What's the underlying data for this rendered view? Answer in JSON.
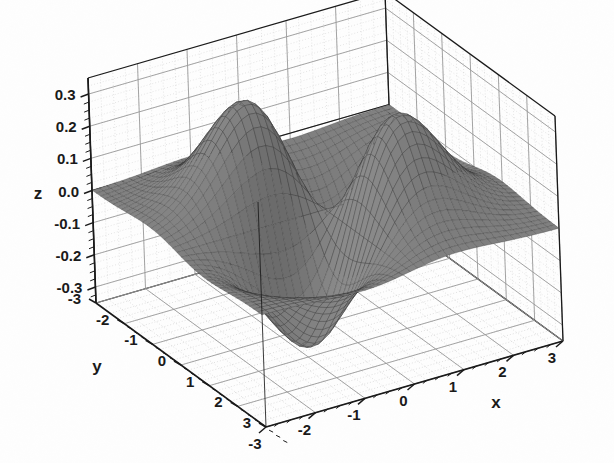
{
  "figure": {
    "kind": "surface-plot",
    "background_color": "#fefefe",
    "ink_color": "#1a1a1a",
    "grid_color": "#9a9a9a",
    "surface_fill": "#5f5f5f",
    "surface_edge": "#2e2e2e"
  },
  "axes": {
    "x": {
      "label": "x",
      "ticks": [
        "-3",
        "-2",
        "-1",
        "0",
        "1",
        "2",
        "3"
      ],
      "tick_values": [
        -3,
        -2,
        -1,
        0,
        1,
        2,
        3
      ],
      "range": [
        -3,
        3
      ]
    },
    "y": {
      "label": "y",
      "ticks": [
        "3",
        "2",
        "1",
        "0",
        "-1",
        "-2",
        "-3"
      ],
      "tick_values": [
        3,
        2,
        1,
        0,
        -1,
        -2,
        -3
      ],
      "range": [
        -3,
        3
      ]
    },
    "z": {
      "label": "z",
      "ticks": [
        "0.3",
        "0.2",
        "0.1",
        "0.0",
        "-0.1",
        "-0.2",
        "-0.3"
      ],
      "tick_values": [
        0.3,
        0.2,
        0.1,
        0.0,
        -0.1,
        -0.2,
        -0.3
      ],
      "range": [
        -0.35,
        0.35
      ]
    }
  },
  "chart_data": {
    "type": "surface",
    "title": "",
    "xlabel": "x",
    "ylabel": "y",
    "zlabel": "z",
    "xlim": [
      -3,
      3
    ],
    "ylim": [
      -3,
      3
    ],
    "zlim": [
      -0.35,
      0.35
    ],
    "xticks": [
      -3,
      -2,
      -1,
      0,
      1,
      2,
      3
    ],
    "yticks": [
      -3,
      -2,
      -1,
      0,
      1,
      2,
      3
    ],
    "zticks": [
      -0.3,
      -0.2,
      -0.1,
      0.0,
      0.1,
      0.2,
      0.3
    ],
    "grid": true,
    "legend": "none",
    "mesh_resolution": 41,
    "projection": {
      "azimuth_deg": 235,
      "elevation_deg": 22
    },
    "function": "z = -x*y*exp(-(x*x + y*y)/2) * 0.86",
    "features": [
      {
        "name": "left-peak",
        "x": -1.0,
        "y": 1.0,
        "z": 0.3
      },
      {
        "name": "right-peak",
        "x": 1.0,
        "y": -1.0,
        "z": 0.32
      },
      {
        "name": "front-trough",
        "x": 1.0,
        "y": 1.0,
        "z": -0.32
      },
      {
        "name": "back-trough",
        "x": -1.0,
        "y": -1.0,
        "z": -0.3
      }
    ],
    "z_extent": {
      "min": -0.32,
      "max": 0.32
    }
  }
}
